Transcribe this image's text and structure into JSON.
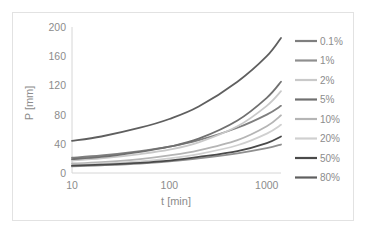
{
  "chart_data": {
    "type": "line",
    "title": "",
    "xlabel": "t [min]",
    "ylabel": "P [mm]",
    "xscale": "log",
    "xlim": [
      10,
      1400
    ],
    "ylim": [
      0,
      200
    ],
    "yticks": [
      0,
      40,
      80,
      120,
      160,
      200
    ],
    "xticks": [
      10,
      100,
      1000
    ],
    "xtick_labels": [
      "10",
      "100",
      "1000"
    ],
    "ytick_labels": [
      "0",
      "40",
      "80",
      "120",
      "160",
      "200"
    ],
    "grid": false,
    "legend_position": "right",
    "x": [
      10,
      20,
      50,
      100,
      200,
      500,
      1000,
      1400
    ],
    "series": [
      {
        "name": "0.1%",
        "color": "#7f7f7f",
        "values": [
          21,
          24,
          30,
          36,
          45,
          62,
          80,
          92
        ]
      },
      {
        "name": "1%",
        "color": "#8f8f8f",
        "values": [
          9,
          10.5,
          13,
          16,
          20,
          27,
          34,
          39
        ]
      },
      {
        "name": "2%",
        "color": "#c9c9c9",
        "values": [
          17,
          20,
          26,
          32,
          42,
          64,
          92,
          112
        ]
      },
      {
        "name": "5%",
        "color": "#707070",
        "values": [
          19,
          22,
          29,
          36,
          47,
          72,
          103,
          125
        ]
      },
      {
        "name": "10%",
        "color": "#b5b5b5",
        "values": [
          13,
          15,
          19,
          24,
          31,
          45,
          64,
          79
        ]
      },
      {
        "name": "20%",
        "color": "#d0d0d0",
        "values": [
          11,
          13,
          16,
          20,
          26,
          38,
          54,
          66
        ]
      },
      {
        "name": "50%",
        "color": "#4a4a4a",
        "values": [
          10,
          11.5,
          14,
          17,
          22,
          30,
          41,
          50
        ]
      },
      {
        "name": "80%",
        "color": "#5f5f5f",
        "values": [
          44,
          50,
          62,
          74,
          91,
          125,
          160,
          185
        ]
      }
    ]
  },
  "axes": {
    "y_title": "P [mm]",
    "x_title": "t [min]"
  },
  "legend": {
    "items": [
      {
        "label": "0.1%"
      },
      {
        "label": "1%"
      },
      {
        "label": "2%"
      },
      {
        "label": "5%"
      },
      {
        "label": "10%"
      },
      {
        "label": "20%"
      },
      {
        "label": "50%"
      },
      {
        "label": "80%"
      }
    ]
  }
}
